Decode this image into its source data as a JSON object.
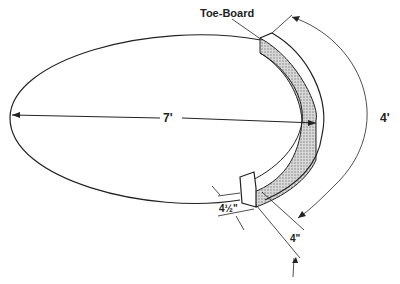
{
  "diagram": {
    "labels": {
      "toe_board": "Toe-Board",
      "diameter": "7'",
      "arc_length": "4'",
      "thickness": "4½\"",
      "height": "4\""
    },
    "colors": {
      "line": "#222222",
      "hatch": "#9a9a9a",
      "background": "#ffffff"
    }
  }
}
